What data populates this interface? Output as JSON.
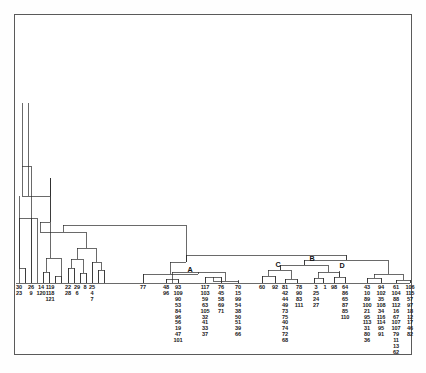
{
  "figure": {
    "type": "dendrogram",
    "title": "",
    "border_color": "#5a5a5a",
    "line_color": "#2b2b2b",
    "background": "#ffffff"
  },
  "cluster_labels": [
    {
      "text": "A",
      "x": 190,
      "y": 271
    },
    {
      "text": "C",
      "x": 278,
      "y": 266
    },
    {
      "text": "B",
      "x": 314,
      "y": 261
    },
    {
      "text": "D",
      "x": 344,
      "y": 267
    }
  ],
  "chart_data": {
    "type": "dendrogram",
    "title": "",
    "xlabel": "",
    "ylabel": "",
    "grid": false,
    "legend": "none",
    "baseline_y": 283,
    "leaf_columns": [
      {
        "x": 19,
        "items": [
          "30",
          "23"
        ]
      },
      {
        "x": 31,
        "items": [
          "26",
          "9"
        ]
      },
      {
        "x": 41,
        "items": [
          "14",
          "120"
        ]
      },
      {
        "x": 50,
        "items": [
          "119",
          "118",
          "121"
        ]
      },
      {
        "x": 68,
        "items": [
          "22",
          "28"
        ]
      },
      {
        "x": 77,
        "items": [
          "29",
          "6"
        ]
      },
      {
        "x": 85,
        "items": [
          "8"
        ]
      },
      {
        "x": 92,
        "items": [
          "25",
          "4",
          "7"
        ]
      },
      {
        "x": 143,
        "items": [
          "77"
        ]
      },
      {
        "x": 166,
        "items": [
          "48",
          "96"
        ]
      },
      {
        "x": 178,
        "items": [
          "93",
          "109",
          "90",
          "53",
          "84",
          "96",
          "56",
          "19",
          "47",
          "101"
        ]
      },
      {
        "x": 205,
        "items": [
          "117",
          "103",
          "59",
          "63",
          "105",
          "32",
          "41",
          "33",
          "37"
        ]
      },
      {
        "x": 221,
        "items": [
          "76",
          "45",
          "58",
          "69",
          "71"
        ]
      },
      {
        "x": 238,
        "items": [
          "70",
          "15",
          "99",
          "54",
          "38",
          "50",
          "51",
          "39",
          "66"
        ]
      },
      {
        "x": 262,
        "items": [
          "60"
        ]
      },
      {
        "x": 275,
        "items": [
          "92"
        ]
      },
      {
        "x": 285,
        "items": [
          "81",
          "42",
          "44",
          "49",
          "73",
          "75",
          "40",
          "74",
          "72",
          "68"
        ]
      },
      {
        "x": 299,
        "items": [
          "78",
          "90",
          "83",
          "111"
        ]
      },
      {
        "x": 316,
        "items": [
          "3",
          "25",
          "24",
          "27"
        ]
      },
      {
        "x": 325,
        "items": [
          "1"
        ]
      },
      {
        "x": 334,
        "items": [
          "98"
        ]
      },
      {
        "x": 345,
        "items": [
          "64",
          "86",
          "65",
          "87",
          "85",
          "110"
        ]
      },
      {
        "x": 367,
        "items": [
          "43",
          "10",
          "89",
          "100",
          "21",
          "95",
          "113",
          "31",
          "80",
          "36"
        ]
      },
      {
        "x": 381,
        "items": [
          "94",
          "102",
          "35",
          "108",
          "34",
          "116",
          "114",
          "95",
          "91"
        ]
      },
      {
        "x": 396,
        "items": [
          "61",
          "104",
          "88",
          "112",
          "16",
          "67",
          "107",
          "107",
          "79",
          "11",
          "13",
          "62"
        ]
      },
      {
        "x": 410,
        "items": [
          "106",
          "115",
          "57",
          "97",
          "18",
          "12",
          "17",
          "46",
          "82"
        ]
      }
    ],
    "links": [
      {
        "x1": 19,
        "x2": 31,
        "y": 211,
        "note": "leftmost pair"
      },
      {
        "x1": 25,
        "x2": 41,
        "y": 161
      },
      {
        "x1": 33,
        "x2": 50,
        "y": 178
      },
      {
        "x1": 41,
        "x2": 56,
        "y": 250
      },
      {
        "x1": 68,
        "x2": 77,
        "y": 268
      },
      {
        "x1": 72,
        "x2": 85,
        "y": 262
      },
      {
        "x1": 78,
        "x2": 92,
        "y": 272
      },
      {
        "x1": 56,
        "x2": 85,
        "y": 244
      },
      {
        "x1": 70,
        "x2": 160,
        "y": 240
      },
      {
        "x1": 143,
        "x2": 190,
        "y": 274
      },
      {
        "x1": 166,
        "x2": 178,
        "y": 278
      },
      {
        "x1": 205,
        "x2": 221,
        "y": 276
      },
      {
        "x1": 213,
        "x2": 238,
        "y": 279
      },
      {
        "x1": 172,
        "x2": 225,
        "y": 273
      },
      {
        "x1": 262,
        "x2": 275,
        "y": 276
      },
      {
        "x1": 268,
        "x2": 285,
        "y": 272
      },
      {
        "x1": 276,
        "x2": 299,
        "y": 269
      },
      {
        "x1": 316,
        "x2": 325,
        "y": 277
      },
      {
        "x1": 320,
        "x2": 334,
        "y": 274
      },
      {
        "x1": 327,
        "x2": 345,
        "y": 270
      },
      {
        "x1": 367,
        "x2": 381,
        "y": 277
      },
      {
        "x1": 396,
        "x2": 410,
        "y": 279
      },
      {
        "x1": 374,
        "x2": 403,
        "y": 273
      },
      {
        "x1": 288,
        "x2": 336,
        "y": 263
      },
      {
        "x1": 312,
        "x2": 388,
        "y": 268
      },
      {
        "x1": 198,
        "x2": 350,
        "y": 265
      },
      {
        "x1": 86,
        "x2": 274,
        "y": 255
      }
    ]
  }
}
